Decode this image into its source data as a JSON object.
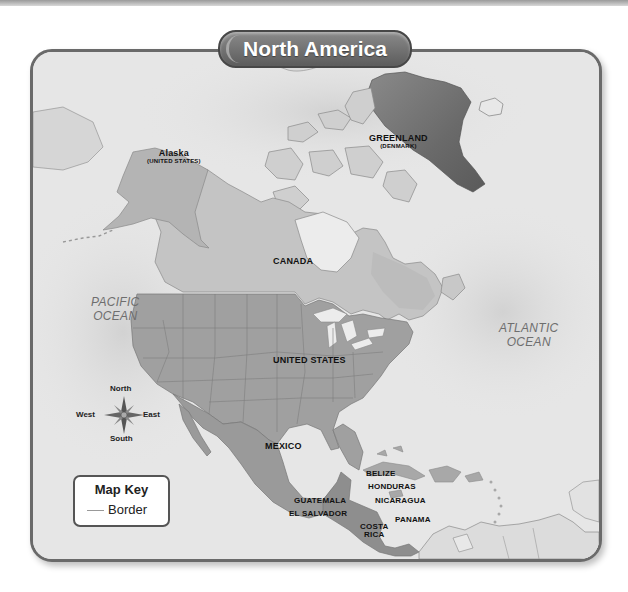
{
  "title": "North America",
  "colors": {
    "ocean": "#e6e6e6",
    "ocean_shallow": "#d4d4d4",
    "land_other": "#c9c9c9",
    "canada": "#bfbfbf",
    "united_states": "#9e9e9e",
    "mexico_central": "#9a9a9a",
    "greenland": "#6e6e6e",
    "frame_border": "#6a6a6a",
    "title_pill": "#6a6a6a"
  },
  "regions": {
    "greenland": {
      "name": "GREENLAND",
      "note": "(DENMARK)"
    },
    "alaska": {
      "name": "Alaska",
      "note": "(UNITED STATES)"
    },
    "canada": {
      "name": "CANADA"
    },
    "united_states": {
      "name": "UNITED STATES"
    },
    "mexico": {
      "name": "MEXICO"
    },
    "belize": {
      "name": "BELIZE"
    },
    "honduras": {
      "name": "HONDURAS"
    },
    "guatemala": {
      "name": "GUATEMALA"
    },
    "el_salvador": {
      "name": "EL SALVADOR"
    },
    "nicaragua": {
      "name": "NICARAGUA"
    },
    "costa_rica": {
      "name": "COSTA\nRICA",
      "line1": "COSTA",
      "line2": "RICA"
    },
    "panama": {
      "name": "PANAMA"
    }
  },
  "oceans": {
    "pacific": {
      "line1": "PACIFIC",
      "line2": "OCEAN"
    },
    "atlantic": {
      "line1": "ATLANTIC",
      "line2": "OCEAN"
    }
  },
  "compass": {
    "icon": "compass-rose-icon",
    "north": "North",
    "south": "South",
    "east": "East",
    "west": "West"
  },
  "map_key": {
    "title": "Map Key",
    "items": [
      {
        "symbol": "border-line",
        "label": "Border"
      }
    ]
  }
}
